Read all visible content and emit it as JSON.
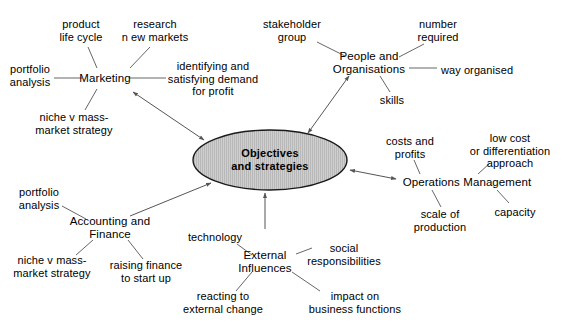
{
  "diagram": {
    "center": {
      "id": "objectives",
      "label": "Objectives\nand strategies",
      "x": 270,
      "y": 160,
      "rx": 77,
      "ry": 30,
      "fill": "#c9c9c9",
      "stroke": "#1a1a1a",
      "hatch": "vertical-lines"
    },
    "colors": {
      "background": "#ffffff",
      "text": "#000000",
      "edge": "#555555",
      "arrow": "#555555",
      "ellipse_fill": "#c9c9c9",
      "ellipse_stroke": "#1a1a1a"
    },
    "hubs": [
      {
        "id": "marketing",
        "label": "Marketing",
        "x": 105,
        "y": 78,
        "arrow_to_center": "double",
        "satellites": [
          {
            "id": "product-life-cycle",
            "label": "product\nlife cycle",
            "x": 81,
            "y": 30
          },
          {
            "id": "research-new-markets",
            "label": "research\nn ew markets",
            "x": 155,
            "y": 30
          },
          {
            "id": "portfolio-analysis-marketing",
            "label": "portfolio\nanalysis",
            "x": 30,
            "y": 75
          },
          {
            "id": "identifying-satisfying-demand",
            "label": "identifying and\nsatisfying demand\nfor profit",
            "x": 213,
            "y": 79
          },
          {
            "id": "niche-v-mass-market-marketing",
            "label": "niche v mass-\nmarket strategy",
            "x": 74,
            "y": 123
          }
        ]
      },
      {
        "id": "people-and-organisations",
        "label": "People and\nOrganisations",
        "x": 369,
        "y": 63,
        "arrow_to_center": "double",
        "satellites": [
          {
            "id": "stakeholder-group",
            "label": "stakeholder\ngroup",
            "x": 292,
            "y": 30
          },
          {
            "id": "number-required",
            "label": "number\nrequired",
            "x": 438,
            "y": 30
          },
          {
            "id": "way-organised",
            "label": "way organised",
            "x": 477,
            "y": 70
          },
          {
            "id": "skills",
            "label": "skills",
            "x": 392,
            "y": 100
          }
        ]
      },
      {
        "id": "operations-management",
        "label": "Operations Management",
        "x": 467,
        "y": 182,
        "arrow_to_center": "double",
        "satellites": [
          {
            "id": "costs-and-profits",
            "label": "costs and\nprofits",
            "x": 410,
            "y": 147
          },
          {
            "id": "low-cost-or-differentiation",
            "label": "low cost\nor differentiation\napproach",
            "x": 510,
            "y": 151
          },
          {
            "id": "scale-of-production",
            "label": "scale of\nproduction",
            "x": 440,
            "y": 220
          },
          {
            "id": "capacity",
            "label": "capacity",
            "x": 515,
            "y": 212
          }
        ]
      },
      {
        "id": "accounting-and-finance",
        "label": "Accounting and\nFinance",
        "x": 110,
        "y": 228,
        "arrow_to_center": "single",
        "satellites": [
          {
            "id": "portfolio-analysis-finance",
            "label": "portfolio\nanalysis",
            "x": 39,
            "y": 198
          },
          {
            "id": "niche-v-mass-market-finance",
            "label": "niche v mass-\nmarket strategy",
            "x": 52,
            "y": 266
          },
          {
            "id": "raising-finance-to-start-up",
            "label": "raising finance\nto start up",
            "x": 146,
            "y": 271
          }
        ]
      },
      {
        "id": "external-influences",
        "label": "External\nInfluences",
        "x": 265,
        "y": 262,
        "arrow_to_center": "single-from-center",
        "satellites": [
          {
            "id": "technology",
            "label": "technology",
            "x": 215,
            "y": 237
          },
          {
            "id": "social-responsibilities",
            "label": "social\nresponsibilities",
            "x": 344,
            "y": 254
          },
          {
            "id": "reacting-to-external-change",
            "label": "reacting to\nexternal change",
            "x": 223,
            "y": 302
          },
          {
            "id": "impact-on-business-functions",
            "label": "impact on\nbusiness functions",
            "x": 355,
            "y": 302
          }
        ]
      }
    ]
  }
}
